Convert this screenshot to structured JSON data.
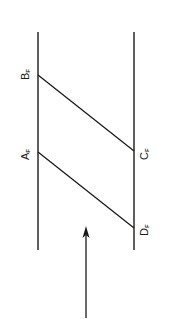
{
  "diagram": {
    "type": "spacetime-parallelogram",
    "stroke_color": "#1a1a1a",
    "background": "#ffffff",
    "lines": {
      "left": {
        "x": 38,
        "y1": 32,
        "y2": 250
      },
      "right": {
        "x": 134,
        "y1": 32,
        "y2": 250
      }
    },
    "points": {
      "B": {
        "label": "B",
        "sub": "F"
      },
      "A": {
        "label": "A",
        "sub": "F"
      },
      "C": {
        "label": "C",
        "sub": "F"
      },
      "D": {
        "label": "D",
        "sub": "F"
      }
    },
    "arrow": {
      "direction": "up"
    }
  }
}
